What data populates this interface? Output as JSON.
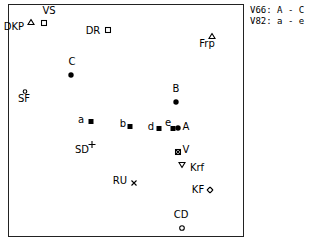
{
  "chart_data": {
    "type": "scatter",
    "title": "",
    "xlabel": "",
    "ylabel": "",
    "grid": false,
    "legend_position": "top-right outside",
    "legend": [
      {
        "key": "V66",
        "value": "A - C"
      },
      {
        "key": "V82",
        "value": "a - e"
      }
    ],
    "points": [
      {
        "label": "DKP",
        "marker": "triangle-open",
        "px": [
          31,
          20
        ],
        "lx": [
          14,
          27
        ]
      },
      {
        "label": "VS",
        "marker": "square-open",
        "px": [
          44,
          21
        ],
        "lx": [
          49,
          11
        ]
      },
      {
        "label": "DR",
        "marker": "square-open",
        "px": [
          108,
          28
        ],
        "lx": [
          93,
          31
        ]
      },
      {
        "label": "Frp",
        "marker": "triangle-open",
        "px": [
          212,
          34
        ],
        "lx": [
          207,
          44
        ]
      },
      {
        "label": "C",
        "marker": "dot",
        "px": [
          71,
          73
        ],
        "lx": [
          72,
          62
        ]
      },
      {
        "label": "SF",
        "marker": "circle-open-small",
        "px": [
          25,
          89
        ],
        "lx": [
          24,
          99
        ]
      },
      {
        "label": "B",
        "marker": "dot",
        "px": [
          176,
          100
        ],
        "lx": [
          176,
          89
        ]
      },
      {
        "label": "a",
        "marker": "square-filled",
        "px": [
          91,
          119
        ],
        "lx": [
          81,
          120
        ]
      },
      {
        "label": "b",
        "marker": "square-filled",
        "px": [
          130,
          124
        ],
        "lx": [
          123,
          124
        ]
      },
      {
        "label": "d",
        "marker": "square-filled",
        "px": [
          159,
          126
        ],
        "lx": [
          151,
          127
        ]
      },
      {
        "label": "e",
        "marker": "square-filled",
        "px": [
          173,
          126
        ],
        "lx": [
          168,
          123
        ]
      },
      {
        "label": "A",
        "marker": "dot",
        "px": [
          178,
          126
        ],
        "lx": [
          186,
          127
        ]
      },
      {
        "label": "V",
        "marker": "square-x",
        "px": [
          178,
          150
        ],
        "lx": [
          186,
          150
        ]
      },
      {
        "label": "SD",
        "marker": "plus",
        "px": [
          92,
          143
        ],
        "lx": [
          82,
          150
        ]
      },
      {
        "label": "Krf",
        "marker": "triangle-down-open",
        "px": [
          182,
          163
        ],
        "lx": [
          197,
          168
        ]
      },
      {
        "label": "KF",
        "marker": "diamond-open",
        "px": [
          210,
          188
        ],
        "lx": [
          198,
          190
        ]
      },
      {
        "label": "RU",
        "marker": "x",
        "px": [
          134,
          181
        ],
        "lx": [
          120,
          181
        ]
      },
      {
        "label": "CD",
        "marker": "circle-open",
        "px": [
          182,
          226
        ],
        "lx": [
          181,
          215
        ]
      }
    ]
  },
  "legend": {
    "line1": "V66: A - C",
    "line2": "V82: a - e"
  }
}
